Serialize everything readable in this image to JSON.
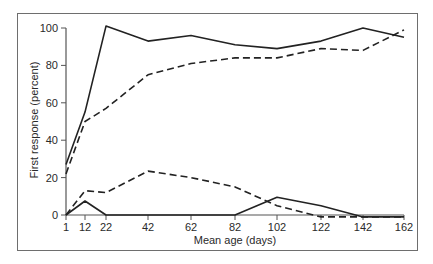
{
  "chart_data": {
    "type": "line",
    "title": "",
    "xlabel": "Mean age (days)",
    "ylabel": "First response (percent)",
    "x": [
      1,
      12,
      22,
      42,
      62,
      82,
      102,
      122,
      142,
      162
    ],
    "x_tick_labels": [
      "1",
      "12",
      "22",
      "42",
      "62",
      "82",
      "102",
      "122",
      "142",
      "162"
    ],
    "y_tick_labels": [
      "0",
      "20",
      "40",
      "60",
      "80",
      "100"
    ],
    "ylim": [
      0,
      100
    ],
    "xlim": [
      1,
      162
    ],
    "grid": false,
    "legend": null,
    "series": [
      {
        "name": "Solid upper",
        "style": "solid",
        "values": [
          27,
          55,
          101,
          93,
          96,
          91,
          89,
          93,
          100,
          95
        ]
      },
      {
        "name": "Dashed upper",
        "style": "dashed",
        "values": [
          22,
          50,
          57,
          75,
          81,
          84,
          84,
          89,
          88,
          99
        ]
      },
      {
        "name": "Dashed lower",
        "style": "dashed",
        "values": [
          0,
          13,
          12,
          23.5,
          20,
          15,
          5,
          -1,
          -1,
          -1
        ]
      },
      {
        "name": "Solid lower",
        "style": "solid",
        "values": [
          0,
          7.5,
          0,
          0,
          0,
          0,
          9.5,
          5,
          -1,
          -1
        ]
      }
    ]
  },
  "colors": {
    "line": "#222222",
    "axis": "#555555",
    "frame": "#6e6e6e"
  }
}
